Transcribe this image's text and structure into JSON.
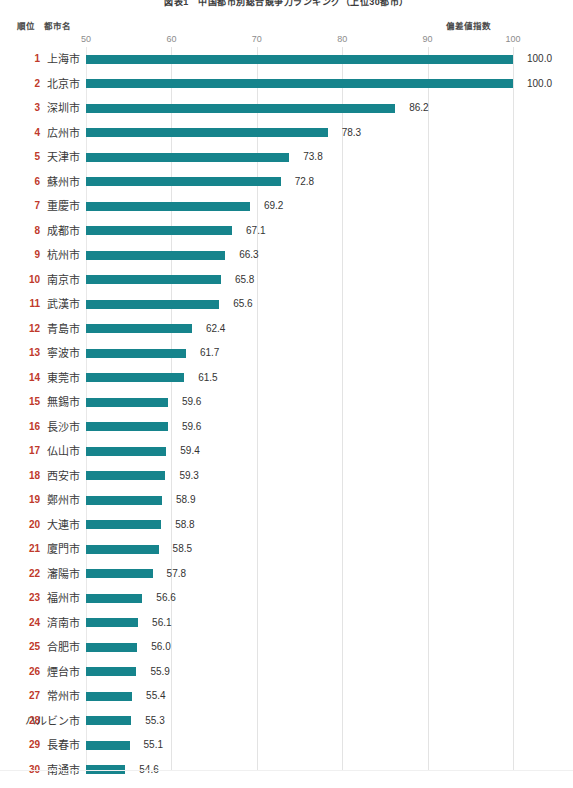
{
  "title": "図表1　中国都市別総合競争力ランキング（上位30都市）",
  "headers": {
    "rank": "順位",
    "city": "都市名",
    "index": "偏差値指数"
  },
  "colors": {
    "bar": "#16848c",
    "rank_text": "#c0392b",
    "value_text": "#333333",
    "gridline": "#e3e3e3",
    "tick_text": "#8c8c8c"
  },
  "chart_data": {
    "type": "bar",
    "orientation": "horizontal",
    "title": "図表1　中国都市別総合競争力ランキング（上位30都市）",
    "xlabel": "偏差値指数",
    "ylabel": "都市名",
    "xlim": [
      50,
      100
    ],
    "xticks": [
      50,
      60,
      70,
      80,
      90,
      100
    ],
    "xtick_labels": [
      "50",
      "60",
      "70",
      "80",
      "90",
      "100"
    ],
    "grid": true,
    "legend": "none",
    "categories": [
      "上海市",
      "北京市",
      "深圳市",
      "広州市",
      "天津市",
      "蘇州市",
      "重慶市",
      "成都市",
      "杭州市",
      "南京市",
      "武漢市",
      "青島市",
      "寧波市",
      "東莞市",
      "無錫市",
      "長沙市",
      "仏山市",
      "西安市",
      "鄭州市",
      "大連市",
      "廈門市",
      "瀋陽市",
      "福州市",
      "済南市",
      "合肥市",
      "煙台市",
      "常州市",
      "ハルビン市",
      "長春市",
      "南通市"
    ],
    "values": [
      100.0,
      100.0,
      86.2,
      78.3,
      73.8,
      72.8,
      69.2,
      67.1,
      66.3,
      65.8,
      65.6,
      62.4,
      61.7,
      61.5,
      59.6,
      59.6,
      59.4,
      59.3,
      58.9,
      58.8,
      58.5,
      57.8,
      56.6,
      56.1,
      56.0,
      55.9,
      55.4,
      55.3,
      55.1,
      54.6
    ],
    "value_labels": [
      "100.0",
      "100.0",
      "86.2",
      "78.3",
      "73.8",
      "72.8",
      "69.2",
      "67.1",
      "66.3",
      "65.8",
      "65.6",
      "62.4",
      "61.7",
      "61.5",
      "59.6",
      "59.6",
      "59.4",
      "59.3",
      "58.9",
      "58.8",
      "58.5",
      "57.8",
      "56.6",
      "56.1",
      "56.0",
      "55.9",
      "55.4",
      "55.3",
      "55.1",
      "54.6"
    ]
  },
  "rows": [
    {
      "rank": "1",
      "city": "上海市",
      "value": 100.0,
      "label": "100.0"
    },
    {
      "rank": "2",
      "city": "北京市",
      "value": 100.0,
      "label": "100.0"
    },
    {
      "rank": "3",
      "city": "深圳市",
      "value": 86.2,
      "label": "86.2"
    },
    {
      "rank": "4",
      "city": "広州市",
      "value": 78.3,
      "label": "78.3"
    },
    {
      "rank": "5",
      "city": "天津市",
      "value": 73.8,
      "label": "73.8"
    },
    {
      "rank": "6",
      "city": "蘇州市",
      "value": 72.8,
      "label": "72.8"
    },
    {
      "rank": "7",
      "city": "重慶市",
      "value": 69.2,
      "label": "69.2"
    },
    {
      "rank": "8",
      "city": "成都市",
      "value": 67.1,
      "label": "67.1"
    },
    {
      "rank": "9",
      "city": "杭州市",
      "value": 66.3,
      "label": "66.3"
    },
    {
      "rank": "10",
      "city": "南京市",
      "value": 65.8,
      "label": "65.8"
    },
    {
      "rank": "11",
      "city": "武漢市",
      "value": 65.6,
      "label": "65.6"
    },
    {
      "rank": "12",
      "city": "青島市",
      "value": 62.4,
      "label": "62.4"
    },
    {
      "rank": "13",
      "city": "寧波市",
      "value": 61.7,
      "label": "61.7"
    },
    {
      "rank": "14",
      "city": "東莞市",
      "value": 61.5,
      "label": "61.5"
    },
    {
      "rank": "15",
      "city": "無錫市",
      "value": 59.6,
      "label": "59.6"
    },
    {
      "rank": "16",
      "city": "長沙市",
      "value": 59.6,
      "label": "59.6"
    },
    {
      "rank": "17",
      "city": "仏山市",
      "value": 59.4,
      "label": "59.4"
    },
    {
      "rank": "18",
      "city": "西安市",
      "value": 59.3,
      "label": "59.3"
    },
    {
      "rank": "19",
      "city": "鄭州市",
      "value": 58.9,
      "label": "58.9"
    },
    {
      "rank": "20",
      "city": "大連市",
      "value": 58.8,
      "label": "58.8"
    },
    {
      "rank": "21",
      "city": "廈門市",
      "value": 58.5,
      "label": "58.5"
    },
    {
      "rank": "22",
      "city": "瀋陽市",
      "value": 57.8,
      "label": "57.8"
    },
    {
      "rank": "23",
      "city": "福州市",
      "value": 56.6,
      "label": "56.6"
    },
    {
      "rank": "24",
      "city": "済南市",
      "value": 56.1,
      "label": "56.1"
    },
    {
      "rank": "25",
      "city": "合肥市",
      "value": 56.0,
      "label": "56.0"
    },
    {
      "rank": "26",
      "city": "煙台市",
      "value": 55.9,
      "label": "55.9"
    },
    {
      "rank": "27",
      "city": "常州市",
      "value": 55.4,
      "label": "55.4"
    },
    {
      "rank": "28",
      "city": "ハルビン市",
      "value": 55.3,
      "label": "55.3"
    },
    {
      "rank": "29",
      "city": "長春市",
      "value": 55.1,
      "label": "55.1"
    },
    {
      "rank": "30",
      "city": "南通市",
      "value": 54.6,
      "label": "54.6"
    }
  ]
}
